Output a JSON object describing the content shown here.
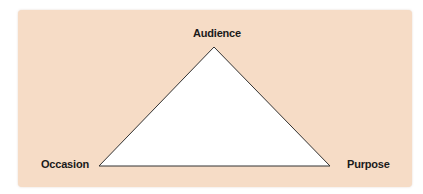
{
  "diagram": {
    "type": "rhetorical-triangle",
    "background_color": "#f6dcc6",
    "triangle_fill": "#ffffff",
    "triangle_stroke": "#333333",
    "vertices": {
      "top": "Audience",
      "bottom_left": "Occasion",
      "bottom_right": "Purpose"
    }
  }
}
